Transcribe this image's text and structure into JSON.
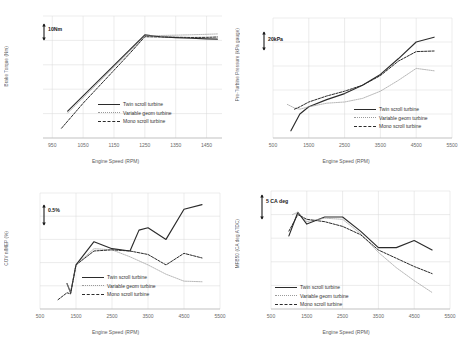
{
  "figure": {
    "series_names": [
      "Twin scroll turbine",
      "Variable geom turbine",
      "Mono scroll turbine"
    ],
    "xlabel": "Engine Speed (RPM)"
  },
  "legend": {
    "twin": "Twin scroll turbine",
    "vgt": "Variable geom turbine",
    "mono": "Mono scroll turbine"
  },
  "chart_data": [
    {
      "type": "line",
      "panel": "top-left",
      "title": "",
      "xlabel": "Engine Speed (RPM)",
      "ylabel": "Brake Torque (Nm)",
      "xlim": [
        920,
        1500
      ],
      "ylim": [
        0,
        100
      ],
      "xticks": [
        950,
        1050,
        1150,
        1250,
        1350,
        1450
      ],
      "yticks": [],
      "grid": true,
      "legend_position": "lower-right",
      "scalebar": {
        "label": "10Nm",
        "value": 10,
        "units": "Nm"
      },
      "series": [
        {
          "name": "Twin scroll turbine",
          "style": "solid",
          "x": [
            1000,
            1050,
            1100,
            1150,
            1200,
            1250,
            1300,
            1350,
            1400,
            1450,
            1485
          ],
          "y": [
            22.0,
            34.5,
            47.0,
            59.5,
            72.0,
            84.5,
            83.0,
            82.3,
            81.8,
            81.3,
            81.0
          ]
        },
        {
          "name": "Variable geom turbine",
          "style": "dotted-thin",
          "x": [
            1000,
            1050,
            1100,
            1150,
            1200,
            1250,
            1300,
            1350,
            1400,
            1450,
            1485
          ],
          "y": [
            20.5,
            33.0,
            45.5,
            58.0,
            70.5,
            83.5,
            84.0,
            84.3,
            84.6,
            85.0,
            85.3
          ]
        },
        {
          "name": "Mono scroll turbine",
          "style": "dashed",
          "x": [
            980,
            1050,
            1100,
            1150,
            1200,
            1250,
            1300,
            1350,
            1400,
            1450,
            1485
          ],
          "y": [
            8.0,
            28.5,
            42.0,
            55.5,
            69.0,
            83.0,
            82.8,
            82.6,
            82.4,
            82.5,
            82.8
          ]
        }
      ]
    },
    {
      "type": "line",
      "panel": "top-right",
      "title": "",
      "xlabel": "Engine Speed (RPM)",
      "ylabel": "Pre-Turbine Pressure (kPa gauge)",
      "xlim": [
        500,
        5500
      ],
      "ylim": [
        0,
        100
      ],
      "xticks": [
        500,
        1500,
        2500,
        3500,
        4500,
        5500
      ],
      "yticks": [],
      "grid": true,
      "legend_position": "lower-right",
      "scalebar": {
        "label": "20kPa",
        "value": 20,
        "units": "kPa"
      },
      "series": [
        {
          "name": "Twin scroll turbine",
          "style": "solid",
          "x": [
            1000,
            1250,
            1500,
            2000,
            2500,
            3000,
            3500,
            4000,
            4500,
            5000
          ],
          "y": [
            6.0,
            20.0,
            26.0,
            32.0,
            37.0,
            44.0,
            53.0,
            66.0,
            80.0,
            84.0
          ]
        },
        {
          "name": "Variable geom turbine",
          "style": "dotted-thin",
          "x": [
            900,
            1100,
            1250,
            1500,
            2000,
            2500,
            3000,
            3500,
            4000,
            4500,
            5000
          ],
          "y": [
            28.0,
            25.0,
            24.0,
            26.0,
            29.0,
            30.0,
            33.0,
            39.0,
            48.0,
            58.0,
            56.0
          ]
        },
        {
          "name": "Mono scroll turbine",
          "style": "dashed",
          "x": [
            1100,
            1250,
            1500,
            2000,
            2500,
            3000,
            3500,
            4000,
            4500,
            5000
          ],
          "y": [
            24.0,
            26.0,
            30.0,
            35.0,
            39.0,
            44.0,
            52.0,
            64.0,
            72.0,
            72.5
          ]
        }
      ]
    },
    {
      "type": "line",
      "panel": "bottom-left",
      "title": "",
      "xlabel": "Engine Speed (RPM)",
      "ylabel": "COV nIMEP (%)",
      "xlim": [
        500,
        5500
      ],
      "ylim": [
        0,
        100
      ],
      "xticks": [
        500,
        1500,
        2500,
        3500,
        4500,
        5500
      ],
      "yticks": [],
      "grid": true,
      "legend_position": "lower-center",
      "scalebar": {
        "label": "0.5%",
        "value": 0.5,
        "units": "%"
      },
      "series": [
        {
          "name": "Twin scroll turbine",
          "style": "solid",
          "x": [
            1250,
            1350,
            1500,
            2000,
            2500,
            3000,
            3250,
            3500,
            4000,
            4500,
            5000
          ],
          "y": [
            22.0,
            14.0,
            38.0,
            58.0,
            52.0,
            50.0,
            68.0,
            70.0,
            60.0,
            86.0,
            90.0
          ]
        },
        {
          "name": "Variable geom turbine",
          "style": "dotted-thin",
          "x": [
            1250,
            1350,
            1500,
            2000,
            2500,
            3000,
            3500,
            4000,
            4500,
            5000
          ],
          "y": [
            22.0,
            14.0,
            38.0,
            52.0,
            51.0,
            45.0,
            38.0,
            30.0,
            24.0,
            23.5
          ]
        },
        {
          "name": "Mono scroll turbine",
          "style": "dashed",
          "x": [
            1000,
            1250,
            1350,
            1500,
            2000,
            2500,
            3000,
            3500,
            4000,
            4500,
            5000
          ],
          "y": [
            8.0,
            14.0,
            13.0,
            38.0,
            50.0,
            51.0,
            50.0,
            47.0,
            38.0,
            48.0,
            44.0
          ]
        }
      ]
    },
    {
      "type": "line",
      "panel": "bottom-right",
      "title": "",
      "xlabel": "Engine Speed (RPM)",
      "ylabel": "MFB50 (CA deg ATDC)",
      "xlim": [
        500,
        5500
      ],
      "ylim": [
        0,
        100
      ],
      "xticks": [
        500,
        1500,
        2500,
        3500,
        4500,
        5500
      ],
      "yticks": [],
      "grid": true,
      "legend_position": "lower-left",
      "scalebar": {
        "label": "5 CA deg",
        "value": 5,
        "units": "CA deg"
      },
      "series": [
        {
          "name": "Twin scroll turbine",
          "style": "solid",
          "x": [
            1000,
            1250,
            1500,
            2000,
            2500,
            3000,
            3500,
            4000,
            4500,
            5000
          ],
          "y": [
            62.0,
            82.0,
            72.0,
            78.0,
            78.0,
            66.0,
            52.0,
            52.0,
            58.0,
            50.0
          ]
        },
        {
          "name": "Variable geom turbine",
          "style": "dotted-thin",
          "x": [
            1100,
            1250,
            1500,
            2000,
            2500,
            3000,
            3500,
            4000,
            4500,
            5000
          ],
          "y": [
            80.0,
            82.0,
            74.0,
            77.0,
            76.0,
            64.0,
            48.0,
            35.0,
            24.0,
            14.0
          ]
        },
        {
          "name": "Mono scroll turbine",
          "style": "dashed",
          "x": [
            1000,
            1250,
            1500,
            2000,
            2500,
            3000,
            3500,
            4000,
            4500,
            5000
          ],
          "y": [
            66.0,
            80.0,
            76.0,
            74.0,
            70.0,
            63.0,
            50.0,
            43.0,
            36.0,
            30.0
          ]
        }
      ]
    }
  ]
}
